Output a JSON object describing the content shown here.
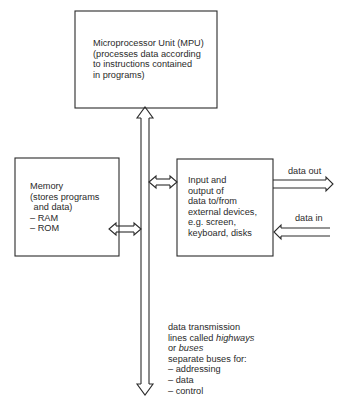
{
  "diagram": {
    "nodes": {
      "mpu": {
        "lines": [
          "Microprocessor Unit (MPU)",
          "(processes data according",
          "to instructions contained",
          "in programs)"
        ]
      },
      "memory": {
        "lines": [
          "Memory",
          "(stores programs",
          " and data)",
          "– RAM",
          "– ROM"
        ]
      },
      "io": {
        "lines": [
          "Input and",
          "output of",
          "data to/from",
          "external devices,",
          "e.g. screen,",
          "keyboard, disks"
        ]
      }
    },
    "edges": {
      "data_out": {
        "label": "data out",
        "direction": "io → external"
      },
      "data_in": {
        "label": "data in",
        "direction": "external → io"
      },
      "memory_bus": {
        "direction": "bidirectional"
      },
      "io_bus": {
        "direction": "bidirectional"
      },
      "mpu_bus": {
        "direction": "bidirectional (vertical bus)"
      }
    },
    "bus_note": {
      "line1": "data transmission",
      "line2_prefix": "lines called ",
      "line2_em": "highways",
      "line3_prefix": "or ",
      "line3_em": "buses",
      "line4": "separate buses for:",
      "items": [
        "– addressing",
        "– data",
        "– control"
      ]
    },
    "colors": {
      "stroke": "#2a2a2a",
      "background": "#ffffff",
      "text": "#2a2a2a"
    }
  }
}
